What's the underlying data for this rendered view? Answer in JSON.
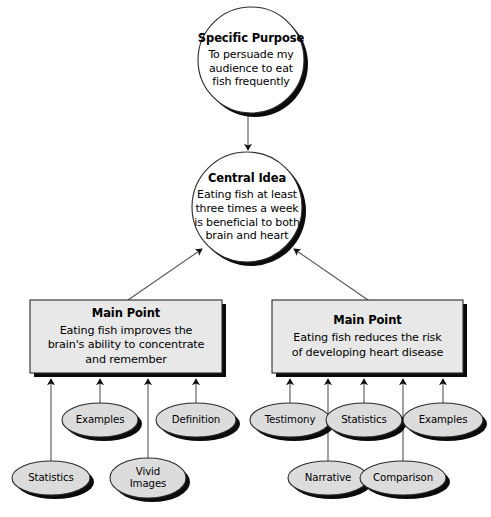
{
  "diagram": {
    "type": "speech-outline-flowchart",
    "title_text": "Speech organization flow chart",
    "colors": {
      "node_fill_circle": "#ffffff",
      "node_fill_box": "#e8e8e8",
      "node_fill_ellipse": "#dcdcdc",
      "stroke": "#1a1a1a",
      "shadow": "#000000",
      "text": "#000000",
      "background": "#ffffff"
    },
    "nodes": {
      "specific_purpose": {
        "shape": "circle",
        "title": "Specific Purpose",
        "body": "To persuade my audience to eat fish frequently",
        "body_lines": [
          "To persuade my",
          "audience to eat",
          "fish frequently"
        ],
        "cx": 251,
        "cy": 60,
        "r": 53
      },
      "central_idea": {
        "shape": "circle",
        "title": "Central Idea",
        "body": "Eating fish at least three times a week is beneficial to both brain and heart",
        "body_lines": [
          "Eating fish at least",
          "three times a week",
          "is beneficial to both",
          "brain and heart"
        ],
        "cx": 247,
        "cy": 207,
        "r": 55
      },
      "main_point_left": {
        "shape": "rect",
        "title": "Main Point",
        "body": "Eating fish improves the brain's ability to concentrate and remember",
        "body_lines": [
          "Eating fish improves the",
          "brain's ability to concentrate",
          "and remember"
        ],
        "x": 30,
        "y": 300,
        "w": 192,
        "h": 73
      },
      "main_point_right": {
        "shape": "rect",
        "title": "Main Point",
        "body": "Eating fish reduces the risk of developing heart disease",
        "body_lines": [
          "Eating fish reduces the risk",
          "of developing heart disease"
        ],
        "x": 272,
        "y": 300,
        "w": 191,
        "h": 73
      }
    },
    "support_left": [
      {
        "label": "Examples",
        "label_lines": [
          "Examples"
        ],
        "cx": 100,
        "cy": 420,
        "rx": 38,
        "ry": 17,
        "row": "upper"
      },
      {
        "label": "Definition",
        "label_lines": [
          "Definition"
        ],
        "cx": 196,
        "cy": 420,
        "rx": 40,
        "ry": 17,
        "row": "upper"
      },
      {
        "label": "Statistics",
        "label_lines": [
          "Statistics"
        ],
        "cx": 51,
        "cy": 478,
        "rx": 39,
        "ry": 17,
        "row": "lower"
      },
      {
        "label": "Vivid Images",
        "label_lines": [
          "Vivid",
          "Images"
        ],
        "cx": 148,
        "cy": 478,
        "rx": 38,
        "ry": 20,
        "row": "lower"
      }
    ],
    "support_right": [
      {
        "label": "Testimony",
        "label_lines": [
          "Testimony"
        ],
        "cx": 290,
        "cy": 420,
        "rx": 40,
        "ry": 17,
        "row": "upper"
      },
      {
        "label": "Statistics",
        "label_lines": [
          "Statistics"
        ],
        "cx": 364,
        "cy": 420,
        "rx": 38,
        "ry": 17,
        "row": "upper"
      },
      {
        "label": "Examples",
        "label_lines": [
          "Examples"
        ],
        "cx": 443,
        "cy": 420,
        "rx": 40,
        "ry": 17,
        "row": "upper"
      },
      {
        "label": "Narrative",
        "label_lines": [
          "Narrative"
        ],
        "cx": 328,
        "cy": 478,
        "rx": 40,
        "ry": 17,
        "row": "lower"
      },
      {
        "label": "Comparison",
        "label_lines": [
          "Comparison"
        ],
        "cx": 403,
        "cy": 478,
        "rx": 43,
        "ry": 17,
        "row": "lower"
      }
    ],
    "connectors": {
      "purpose_to_idea": {
        "from": "specific_purpose",
        "to": "central_idea",
        "style": "arrow-down"
      },
      "left_main_to_idea": {
        "from": "main_point_left",
        "to": "central_idea",
        "style": "arrow-diagonal-up-right"
      },
      "right_main_to_idea": {
        "from": "main_point_right",
        "to": "central_idea",
        "style": "arrow-diagonal-up-left"
      },
      "left_supports_count": 4,
      "right_supports_count": 5,
      "support_style": "arrow-up"
    }
  }
}
